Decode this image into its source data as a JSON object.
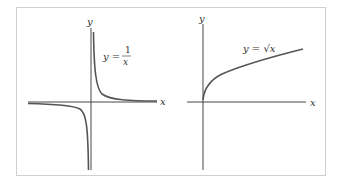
{
  "figure": {
    "left_panel": {
      "x_axis_label": "x",
      "y_axis_label": "y",
      "equation_lhs": "y =",
      "equation_numerator": "1",
      "equation_denominator": "x",
      "function": "1/x"
    },
    "right_panel": {
      "x_axis_label": "x",
      "y_axis_label": "y",
      "equation": "y = √x",
      "function": "sqrt(x)"
    },
    "colors": {
      "axis": "#333333",
      "curve": "#555555",
      "border": "#cfcfcf"
    }
  }
}
